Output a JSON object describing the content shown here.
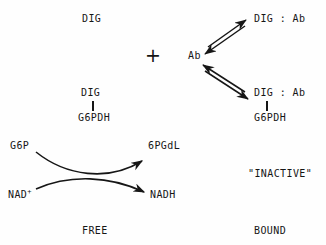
{
  "diagram": {
    "background_color": "#fefefe",
    "ink_color": "#161616",
    "width": 326,
    "height": 245
  },
  "labels": {
    "free_dig": "DIG",
    "plus_sign": "+",
    "antibody": "Ab",
    "bound_dig_ab_top": "DIG : Ab",
    "bound_dig_ab_bottom": "DIG : Ab",
    "free_conjugate_dig": "DIG",
    "free_conjugate_enzyme": "G6PDH",
    "bound_conjugate_enzyme": "G6PDH",
    "substrate_g6p": "G6P",
    "cofactor_nad": "NAD",
    "cofactor_nad_charge": "+",
    "product_6pgdl": "6PGdL",
    "product_nadh": "NADH",
    "inactive_note": "\"INACTIVE\"",
    "column_free": "FREE",
    "column_bound": "BOUND"
  },
  "icons": {
    "equilibrium_top": "double-arrow-equilibrium-icon",
    "equilibrium_bottom": "double-arrow-equilibrium-icon",
    "enzyme_reaction": "crossed-curved-arrows-icon",
    "bond_free": "vertical-bond-icon",
    "bond_bound": "vertical-bond-icon"
  }
}
